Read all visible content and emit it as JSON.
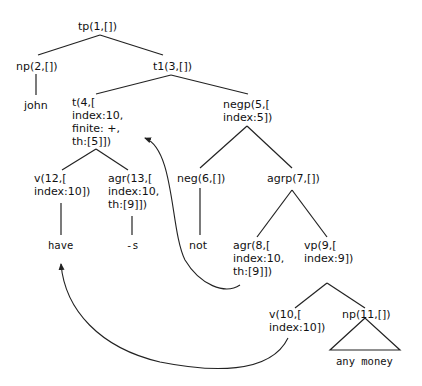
{
  "diagram": {
    "type": "syntax-tree",
    "nodes": {
      "n1": "tp(1,[])",
      "n2": "np(2,[])",
      "n3": "t1(3,[])",
      "john": "john",
      "n4": "t(4,[\nindex:10,\nfinite: +,\nth:[5]])",
      "n5": "negp(5,[\nindex:5])",
      "n12": "v(12,[\nindex:10])",
      "n13": "agr(13,[\nindex:10,\nth:[9]])",
      "n6": "neg(6,[])",
      "n7": "agrp(7,[])",
      "have": "have",
      "s": "-s",
      "not": "not",
      "n8": "agr(8,[\nindex:10,\nth:[9]])",
      "n9": "vp(9,[\nindex:9])",
      "n10": "v(10,[\nindex:10])",
      "n11": "np(11,[])",
      "any_money": "any money"
    },
    "edges": [
      [
        "tp(1)",
        "np(2)"
      ],
      [
        "tp(1)",
        "t1(3)"
      ],
      [
        "np(2)",
        "john"
      ],
      [
        "t1(3)",
        "t(4)"
      ],
      [
        "t1(3)",
        "negp(5)"
      ],
      [
        "t(4)",
        "v(12)"
      ],
      [
        "t(4)",
        "agr(13)"
      ],
      [
        "v(12)",
        "have"
      ],
      [
        "agr(13)",
        "-s"
      ],
      [
        "negp(5)",
        "neg(6)"
      ],
      [
        "negp(5)",
        "agrp(7)"
      ],
      [
        "neg(6)",
        "not"
      ],
      [
        "agrp(7)",
        "agr(8)"
      ],
      [
        "agrp(7)",
        "vp(9)"
      ],
      [
        "vp(9)",
        "v(10)"
      ],
      [
        "vp(9)",
        "np(11)"
      ],
      [
        "np(11)",
        "any money (triangle)"
      ]
    ],
    "movement_arrows": [
      {
        "from": "agr(8)",
        "to": "t(4)"
      },
      {
        "from": "v(10)",
        "to": "have"
      }
    ]
  }
}
